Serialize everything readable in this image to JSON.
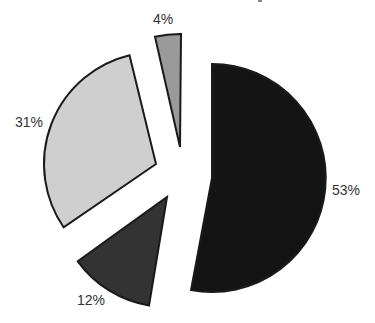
{
  "chart_data": {
    "type": "pie",
    "exploded": true,
    "title": "",
    "categories": [
      "Slice A",
      "Slice B",
      "Slice C",
      "Slice D"
    ],
    "values": [
      53,
      12,
      31,
      4
    ],
    "labels": [
      "53%",
      "12%",
      "31%",
      "4%"
    ],
    "colors": [
      "#141414",
      "#333333",
      "#cfcfcf",
      "#9a9a9a"
    ],
    "legend": "none",
    "slices": [
      {
        "label": "53%",
        "value": 53,
        "color": "#141414",
        "apex": [
          212,
          178
        ],
        "r": 114,
        "start": -90,
        "end": 100.6,
        "label_pos": [
          332,
          195
        ]
      },
      {
        "label": "12%",
        "value": 12,
        "color": "#333333",
        "apex": [
          167,
          197
        ],
        "r": 110,
        "start": 99.4,
        "end": 144.2,
        "label_pos": [
          77,
          305
        ]
      },
      {
        "label": "31%",
        "value": 31,
        "color": "#cfcfcf",
        "apex": [
          156,
          164
        ],
        "r": 112,
        "start": 145.6,
        "end": 256.3,
        "label_pos": [
          15,
          127
        ]
      },
      {
        "label": "4%",
        "value": 4,
        "color": "#9a9a9a",
        "apex": [
          180,
          147
        ],
        "r": 113,
        "start": 257.2,
        "end": 270.5,
        "label_pos": [
          153,
          24
        ]
      }
    ]
  }
}
